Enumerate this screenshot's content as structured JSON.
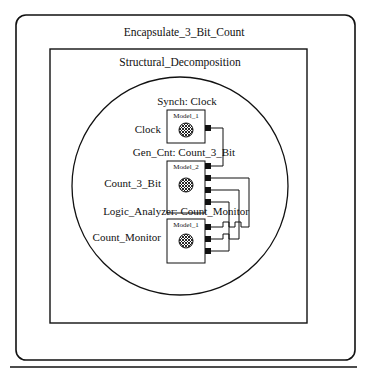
{
  "diagram": {
    "outer_box": {
      "title": "Encapsulate_3_Bit_Count"
    },
    "inner_box": {
      "title": "Structural_Decomposition"
    },
    "components": [
      {
        "instance_label": "Synch: Clock",
        "role_label": "Clock",
        "model": "Model_1",
        "ports": 1,
        "icon": "crosshatch-sphere-icon"
      },
      {
        "instance_label": "Gen_Cnt: Count_3_Bit",
        "role_label": "Count_3_Bit",
        "model": "Model_2",
        "ports": 4,
        "icon": "crosshatch-sphere-icon"
      },
      {
        "instance_label": "Logic_Analyzer: Count_Monitor",
        "role_label": "Count_Monitor",
        "model": "Model_1",
        "ports": 3,
        "icon": "crosshatch-sphere-icon"
      }
    ],
    "colors": {
      "line": "#111111",
      "background": "#ffffff",
      "port_fill": "#111111"
    }
  }
}
